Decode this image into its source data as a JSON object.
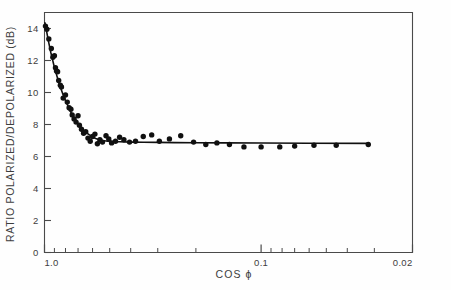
{
  "chart_data": {
    "type": "scatter",
    "title": "",
    "xlabel": "COS ϕ",
    "ylabel": "RATIO POLARIZED/DEPOLARIZED (dB)",
    "x_scale": "log",
    "x_direction": "decreasing",
    "xlim": [
      1.0,
      0.02
    ],
    "ylim": [
      0,
      15
    ],
    "yticks": [
      0,
      2,
      4,
      6,
      8,
      10,
      12,
      14
    ],
    "ytick_labels": [
      "0",
      "2",
      "4",
      "6",
      "8",
      "10",
      "12",
      "14"
    ],
    "xticks": [
      1.0,
      0.1,
      0.02
    ],
    "xtick_labels": [
      "1.0",
      "0.1",
      "0.02"
    ],
    "minor_xticks": [
      0.9,
      0.8,
      0.7,
      0.6,
      0.5,
      0.4,
      0.3,
      0.2,
      0.09,
      0.08,
      0.07,
      0.06,
      0.05,
      0.04,
      0.03
    ],
    "grid": false,
    "legend": null,
    "marker_color": "#101010",
    "line_color": "#101010",
    "axis_color": "#4a4a4a",
    "series": [
      {
        "name": "measurements",
        "marker": "filled-circle",
        "points": [
          [
            0.99,
            14.15
          ],
          [
            0.975,
            13.95
          ],
          [
            0.955,
            13.35
          ],
          [
            0.93,
            12.75
          ],
          [
            0.915,
            12.2
          ],
          [
            0.9,
            12.3
          ],
          [
            0.89,
            11.55
          ],
          [
            0.88,
            11.35
          ],
          [
            0.87,
            11.3
          ],
          [
            0.86,
            10.75
          ],
          [
            0.845,
            10.45
          ],
          [
            0.835,
            10.35
          ],
          [
            0.82,
            9.65
          ],
          [
            0.8,
            9.85
          ],
          [
            0.785,
            9.4
          ],
          [
            0.77,
            9.05
          ],
          [
            0.755,
            8.95
          ],
          [
            0.745,
            8.6
          ],
          [
            0.73,
            8.35
          ],
          [
            0.715,
            8.15
          ],
          [
            0.7,
            8.55
          ],
          [
            0.69,
            7.95
          ],
          [
            0.675,
            7.7
          ],
          [
            0.66,
            7.45
          ],
          [
            0.645,
            7.55
          ],
          [
            0.63,
            7.15
          ],
          [
            0.615,
            6.95
          ],
          [
            0.6,
            7.25
          ],
          [
            0.585,
            7.4
          ],
          [
            0.57,
            6.8
          ],
          [
            0.555,
            7.05
          ],
          [
            0.54,
            6.9
          ],
          [
            0.52,
            7.3
          ],
          [
            0.505,
            7.1
          ],
          [
            0.49,
            6.85
          ],
          [
            0.47,
            6.95
          ],
          [
            0.45,
            7.2
          ],
          [
            0.43,
            7.05
          ],
          [
            0.405,
            6.9
          ],
          [
            0.38,
            6.95
          ],
          [
            0.35,
            7.25
          ],
          [
            0.32,
            7.35
          ],
          [
            0.295,
            6.95
          ],
          [
            0.265,
            7.1
          ],
          [
            0.235,
            7.3
          ],
          [
            0.205,
            6.9
          ],
          [
            0.18,
            6.75
          ],
          [
            0.16,
            6.85
          ],
          [
            0.14,
            6.75
          ],
          [
            0.12,
            6.6
          ],
          [
            0.1,
            6.6
          ],
          [
            0.082,
            6.6
          ],
          [
            0.07,
            6.65
          ],
          [
            0.057,
            6.7
          ],
          [
            0.045,
            6.7
          ],
          [
            0.032,
            6.75
          ]
        ]
      }
    ],
    "fit_curve": {
      "name": "fitted-curve",
      "points": [
        [
          0.995,
          14.35
        ],
        [
          0.98,
          13.9
        ],
        [
          0.965,
          13.4
        ],
        [
          0.95,
          12.95
        ],
        [
          0.935,
          12.5
        ],
        [
          0.92,
          12.1
        ],
        [
          0.905,
          11.7
        ],
        [
          0.89,
          11.35
        ],
        [
          0.875,
          11.0
        ],
        [
          0.86,
          10.65
        ],
        [
          0.845,
          10.35
        ],
        [
          0.83,
          10.05
        ],
        [
          0.815,
          9.75
        ],
        [
          0.8,
          9.5
        ],
        [
          0.785,
          9.25
        ],
        [
          0.77,
          9.0
        ],
        [
          0.755,
          8.75
        ],
        [
          0.74,
          8.55
        ],
        [
          0.725,
          8.35
        ],
        [
          0.71,
          8.15
        ],
        [
          0.695,
          8.0
        ],
        [
          0.68,
          7.85
        ],
        [
          0.665,
          7.7
        ],
        [
          0.65,
          7.55
        ],
        [
          0.635,
          7.45
        ],
        [
          0.62,
          7.35
        ],
        [
          0.6,
          7.22
        ],
        [
          0.58,
          7.12
        ],
        [
          0.56,
          7.05
        ],
        [
          0.54,
          7.0
        ],
        [
          0.51,
          6.95
        ],
        [
          0.48,
          6.93
        ],
        [
          0.45,
          6.92
        ],
        [
          0.4,
          6.9
        ],
        [
          0.35,
          6.89
        ],
        [
          0.3,
          6.88
        ],
        [
          0.25,
          6.87
        ],
        [
          0.2,
          6.86
        ],
        [
          0.15,
          6.85
        ],
        [
          0.1,
          6.84
        ],
        [
          0.06,
          6.83
        ],
        [
          0.032,
          6.82
        ]
      ]
    }
  }
}
